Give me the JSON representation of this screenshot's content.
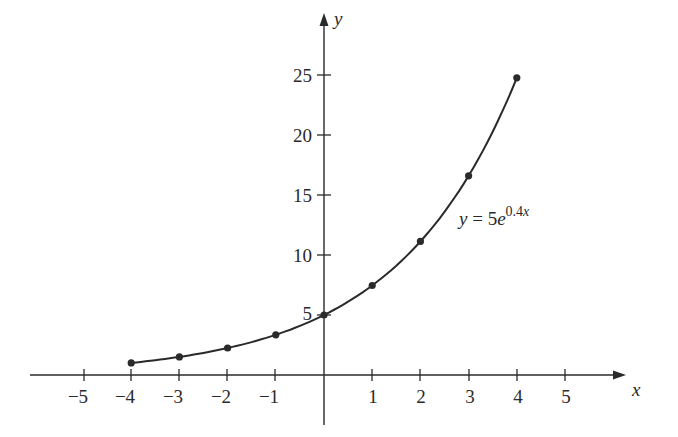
{
  "chart_data": {
    "type": "line",
    "title": "",
    "xlabel": "x",
    "ylabel": "y",
    "xlim": [
      -5.8,
      6.4
    ],
    "ylim": [
      0,
      28
    ],
    "grid": false,
    "x_ticks": [
      -5,
      -4,
      -3,
      -2,
      -1,
      1,
      2,
      3,
      4,
      5
    ],
    "x_tick_labels": [
      "−5",
      "−4",
      "−3",
      "−2",
      "−1",
      "1",
      "2",
      "3",
      "4",
      "5"
    ],
    "y_ticks": [
      5,
      10,
      15,
      20,
      25
    ],
    "y_tick_labels": [
      "5",
      "10",
      "15",
      "20",
      "25"
    ],
    "series": [
      {
        "name": "y = 5e^(0.4x)",
        "x": [
          -4,
          -3,
          -2,
          -1,
          0,
          1,
          2,
          3,
          4
        ],
        "values": [
          1.01,
          1.51,
          2.25,
          3.35,
          5.0,
          7.46,
          11.13,
          16.6,
          24.77
        ],
        "markers": true
      }
    ],
    "annotations": [
      {
        "text_main": "y = 5e",
        "text_sup": "0.4x",
        "x": 3.0,
        "y": 12.8
      }
    ],
    "colors": {
      "ink": "#2a2a2a",
      "background": "#ffffff"
    }
  },
  "labels": {
    "x_axis": "x",
    "y_axis": "y",
    "eq_y": "y",
    "eq_equals": " = 5",
    "eq_e": "e",
    "eq_exp": "0.4",
    "eq_exp_x": "x",
    "xt": [
      "−5",
      "−4",
      "−3",
      "−2",
      "−1",
      "1",
      "2",
      "3",
      "4",
      "5"
    ],
    "yt": [
      "25",
      "20",
      "15",
      "10",
      "5"
    ]
  }
}
